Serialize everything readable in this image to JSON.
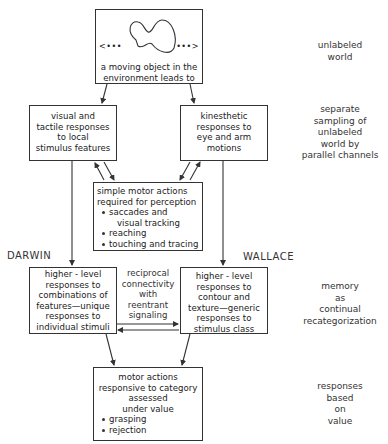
{
  "diagram": {
    "type": "flowchart",
    "nodes": {
      "world": {
        "caption": [
          "a moving object in the",
          "environment leads to"
        ],
        "left_dots": "<•••",
        "right_dots": "•••>"
      },
      "visual": {
        "lines": [
          "visual and",
          "tactile responses",
          "to local",
          "stimulus features"
        ]
      },
      "kinesthetic": {
        "lines": [
          "kinesthetic",
          "responses to",
          "eye and arm",
          "motions"
        ]
      },
      "simple_motor": {
        "lines": [
          "simple motor actions",
          "required for perception"
        ],
        "bullets": [
          {
            "text": "saccades and",
            "continuation": "visual tracking"
          },
          {
            "text": "reaching"
          },
          {
            "text": "touching and tracing"
          }
        ]
      },
      "darwin": {
        "lines": [
          "higher - level",
          "responses to",
          "combinations of",
          "features—unique",
          "responses to",
          "individual stimuli"
        ]
      },
      "wallace": {
        "lines": [
          "higher - level",
          "responses to",
          "contour and",
          "texture—generic",
          "responses to",
          "stimulus class"
        ]
      },
      "motor_value": {
        "lines": [
          "motor actions",
          "responsive to category",
          "assessed",
          "under  value"
        ],
        "bullets": [
          "grasping",
          "rejection"
        ]
      }
    },
    "labels": {
      "darwin": "DARWIN",
      "wallace": "WALLACE",
      "reentrant": [
        "reciprocal",
        "connectivity",
        "with",
        "reentrant",
        "signaling"
      ]
    },
    "side_annotations": [
      {
        "lines": [
          "unlabeled",
          "world"
        ]
      },
      {
        "lines": [
          "separate",
          "sampling of",
          "unlabeled",
          "world by",
          "parallel channels"
        ]
      },
      {
        "lines": [
          "memory",
          "as",
          "continual",
          "recategorization"
        ]
      },
      {
        "lines": [
          "responses",
          "based",
          "on",
          "value"
        ]
      }
    ],
    "edges": [
      [
        "world",
        "visual"
      ],
      [
        "world",
        "kinesthetic"
      ],
      [
        "visual",
        "simple_motor"
      ],
      [
        "simple_motor",
        "visual"
      ],
      [
        "kinesthetic",
        "simple_motor"
      ],
      [
        "simple_motor",
        "kinesthetic"
      ],
      [
        "visual",
        "darwin"
      ],
      [
        "kinesthetic",
        "wallace"
      ],
      [
        "darwin",
        "wallace"
      ],
      [
        "wallace",
        "darwin"
      ],
      [
        "darwin",
        "motor_value"
      ],
      [
        "wallace",
        "motor_value"
      ]
    ]
  }
}
